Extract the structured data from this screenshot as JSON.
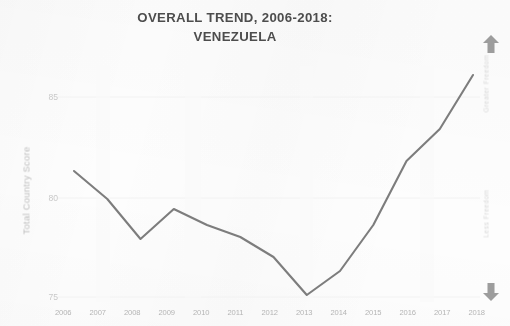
{
  "chart_data": {
    "type": "line",
    "title": "OVERALL TREND, 2006-2018:",
    "subtitle": "VENEZUELA",
    "xlabel": "",
    "ylabel": "Total Country Score",
    "categories": [
      "2006",
      "2007",
      "2008",
      "2009",
      "2010",
      "2011",
      "2012",
      "2013",
      "2014",
      "2015",
      "2016",
      "2017",
      "2018"
    ],
    "values": [
      81.3,
      79.9,
      77.9,
      79.4,
      78.6,
      78.0,
      77.0,
      75.1,
      76.3,
      78.6,
      81.8,
      83.4,
      86.1
    ],
    "series": [
      {
        "name": "Total Country Score",
        "values": [
          81.3,
          79.9,
          77.9,
          79.4,
          78.6,
          78.0,
          77.0,
          75.1,
          76.3,
          78.6,
          81.8,
          83.4,
          86.1
        ]
      }
    ],
    "y_ticks": [
      "85",
      "80",
      "75"
    ],
    "ylim": [
      74.0,
      87.0
    ],
    "grid": true,
    "legend": "none",
    "line_color": "#6b6b6b",
    "annotations": {
      "right_axis_top": "Greater Freedom",
      "right_axis_bottom": "Less Freedom"
    }
  },
  "chart": {
    "title_line1": "OVERALL TREND, 2006-2018:",
    "title_line2": "VENEZUELA",
    "y_axis_title": "Total Country Score",
    "y_ticks": [
      "85",
      "80",
      "75"
    ],
    "x_ticks": [
      "2006",
      "2007",
      "2008",
      "2009",
      "2010",
      "2011",
      "2012",
      "2013",
      "2014",
      "2015",
      "2016",
      "2017",
      "2018"
    ]
  },
  "freedom_scale": {
    "up_label": "Greater Freedom",
    "down_label": "Less Freedom",
    "up_icon": "arrow-up-icon",
    "down_icon": "arrow-down-icon"
  }
}
